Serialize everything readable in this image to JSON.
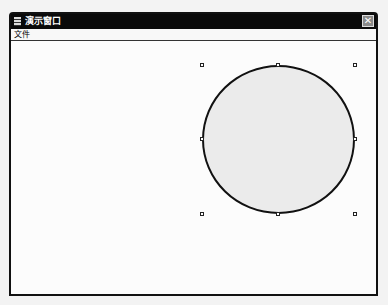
{
  "window": {
    "title": "演示窗口",
    "close_glyph": "✕",
    "icon": "app-icon"
  },
  "menubar": {
    "items": [
      {
        "label": "文件"
      }
    ]
  },
  "canvas": {
    "shape": {
      "type": "ellipse",
      "fill": "#ebebeb",
      "stroke": "#111111",
      "selected": true
    },
    "handles": [
      "top-left",
      "top-middle",
      "top-right",
      "middle-left",
      "middle-right",
      "bottom-left",
      "bottom-middle",
      "bottom-right"
    ]
  }
}
